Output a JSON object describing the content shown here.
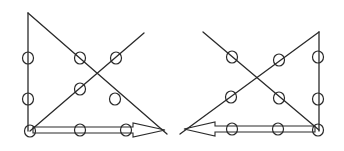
{
  "figure": {
    "stroke_color": "#2a2a2a",
    "background": "#ffffff",
    "panels": [
      {
        "id": "left",
        "dots": [
          {
            "x": 28,
            "y": 58
          },
          {
            "x": 80,
            "y": 58
          },
          {
            "x": 116,
            "y": 58
          },
          {
            "x": 28,
            "y": 99
          },
          {
            "x": 80,
            "y": 89
          },
          {
            "x": 115,
            "y": 99
          },
          {
            "x": 30,
            "y": 131
          },
          {
            "x": 80,
            "y": 130
          },
          {
            "x": 126,
            "y": 130
          }
        ],
        "lines": [
          {
            "x1": 28,
            "y1": 13,
            "x2": 28,
            "y2": 131
          },
          {
            "x1": 28,
            "y1": 13,
            "x2": 167,
            "y2": 134
          },
          {
            "x1": 30,
            "y1": 131,
            "x2": 144,
            "y2": 33
          }
        ],
        "arrow": {
          "direction": "right",
          "x_start": 33,
          "x_end": 165,
          "y": 130,
          "head_base_x": 133
        }
      },
      {
        "id": "right",
        "dots": [
          {
            "x": 232,
            "y": 57
          },
          {
            "x": 279,
            "y": 60
          },
          {
            "x": 318,
            "y": 57
          },
          {
            "x": 231,
            "y": 97
          },
          {
            "x": 279,
            "y": 98
          },
          {
            "x": 318,
            "y": 99
          },
          {
            "x": 232,
            "y": 129
          },
          {
            "x": 278,
            "y": 129
          },
          {
            "x": 318,
            "y": 130
          }
        ],
        "lines": [
          {
            "x1": 319,
            "y1": 32,
            "x2": 319,
            "y2": 131
          },
          {
            "x1": 203,
            "y1": 32,
            "x2": 319,
            "y2": 130
          },
          {
            "x1": 319,
            "y1": 32,
            "x2": 180,
            "y2": 134
          }
        ],
        "arrow": {
          "direction": "left",
          "x_start": 315,
          "x_end": 184,
          "y": 129,
          "head_base_x": 215
        }
      }
    ]
  }
}
